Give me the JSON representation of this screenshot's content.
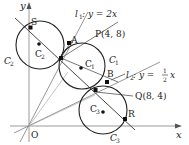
{
  "diagram": {
    "axes": {
      "x_label": "x",
      "y_label": "y",
      "origin_label": "O"
    },
    "lines": [
      {
        "id": "l1",
        "label": "l",
        "sub": "1",
        "equation": " : y = 2x"
      },
      {
        "id": "l2",
        "label": "l",
        "sub": "2",
        "equation": " : y = ",
        "frac_num": "1",
        "frac_den": "2",
        "tail": "x"
      }
    ],
    "points": {
      "S": "S",
      "A": "A",
      "P": "P(4, 8)",
      "B": "B",
      "Q": "Q(8, 4)",
      "R": "R"
    },
    "circles": {
      "C1": {
        "label": "C",
        "sub": "1"
      },
      "C2": {
        "label": "C",
        "sub": "2"
      },
      "C3": {
        "label": "C",
        "sub": "3"
      }
    },
    "center_labels": {
      "C1": {
        "label": "C",
        "sub": "1"
      },
      "C2": {
        "label": "C",
        "sub": "2"
      },
      "C3": {
        "label": "C",
        "sub": "3"
      }
    },
    "colors": {
      "stroke": "#222222",
      "axis": "#999999",
      "aux": "#888888"
    }
  }
}
